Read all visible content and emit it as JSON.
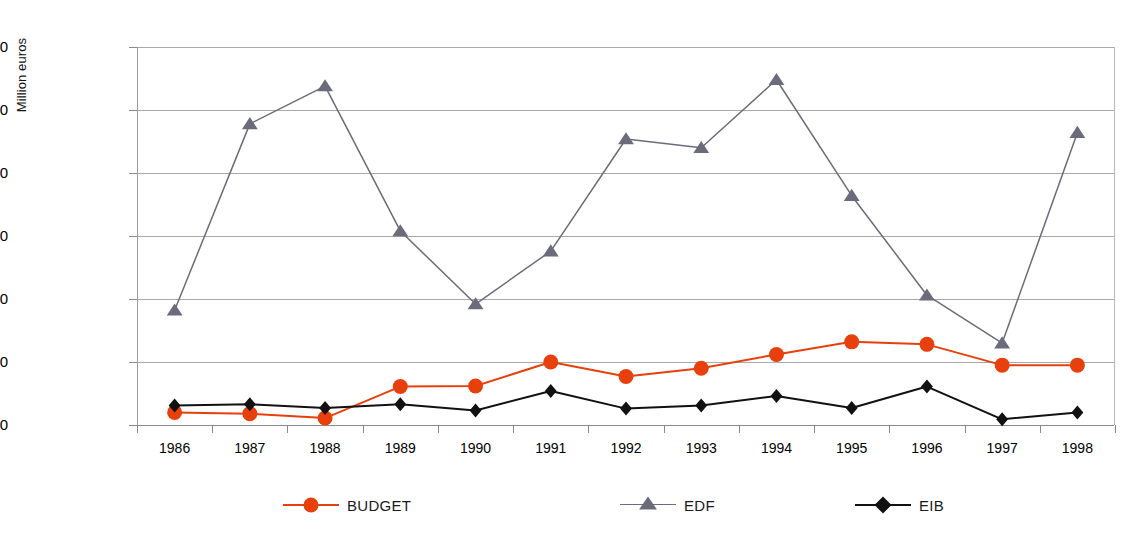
{
  "chart_data": {
    "type": "line",
    "title": "",
    "xlabel": "",
    "ylabel": "Million euros",
    "ylim": [
      0,
      3000
    ],
    "ytick_step": 500,
    "grid": true,
    "legend_position": "bottom",
    "categories": [
      "1986",
      "1987",
      "1988",
      "1989",
      "1990",
      "1991",
      "1992",
      "1993",
      "1994",
      "1995",
      "1996",
      "1997",
      "1998"
    ],
    "yticks": [
      "0",
      "500",
      "1000",
      "1500",
      "2000",
      "2500",
      "3000"
    ],
    "series": [
      {
        "name": "BUDGET",
        "color": "#E8400C",
        "marker": "circle",
        "values": [
          100,
          90,
          55,
          305,
          310,
          500,
          385,
          450,
          560,
          660,
          640,
          475,
          475
        ]
      },
      {
        "name": "EDF",
        "color": "#6B6B7B",
        "marker": "triangle",
        "values": [
          910,
          2390,
          2690,
          1540,
          960,
          1380,
          2270,
          2200,
          2740,
          1820,
          1030,
          650,
          2320
        ]
      },
      {
        "name": "EIB",
        "color": "#111111",
        "marker": "diamond",
        "values": [
          155,
          165,
          135,
          165,
          115,
          270,
          130,
          155,
          230,
          135,
          305,
          45,
          100
        ]
      }
    ]
  },
  "legend": {
    "items": [
      {
        "label": "BUDGET",
        "icon": "circle-marker-icon"
      },
      {
        "label": "EDF",
        "icon": "triangle-marker-icon"
      },
      {
        "label": "EIB",
        "icon": "diamond-marker-icon"
      }
    ]
  },
  "axes": {
    "y_title": "Million euros"
  }
}
